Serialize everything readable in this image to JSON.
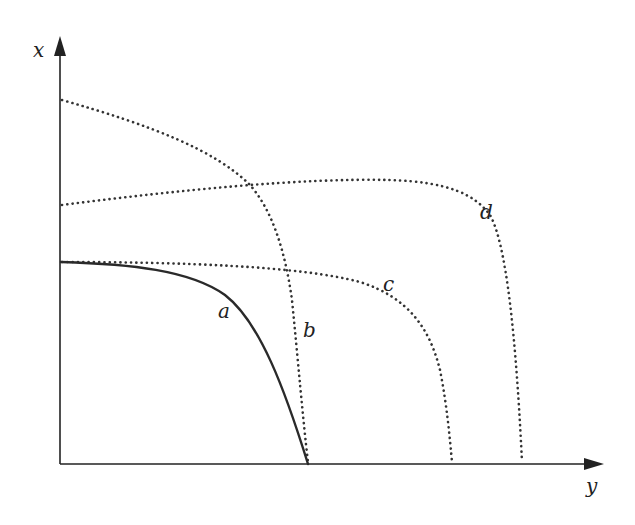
{
  "diagram": {
    "axes": {
      "vertical_label": "x",
      "horizontal_label": "y"
    },
    "curves": [
      {
        "id": "a",
        "label": "a",
        "style": "solid"
      },
      {
        "id": "b",
        "label": "b",
        "style": "dotted"
      },
      {
        "id": "c",
        "label": "c",
        "style": "dotted"
      },
      {
        "id": "d",
        "label": "d",
        "style": "dotted"
      }
    ],
    "colors": {
      "line": "#222222",
      "background": "#ffffff"
    }
  }
}
